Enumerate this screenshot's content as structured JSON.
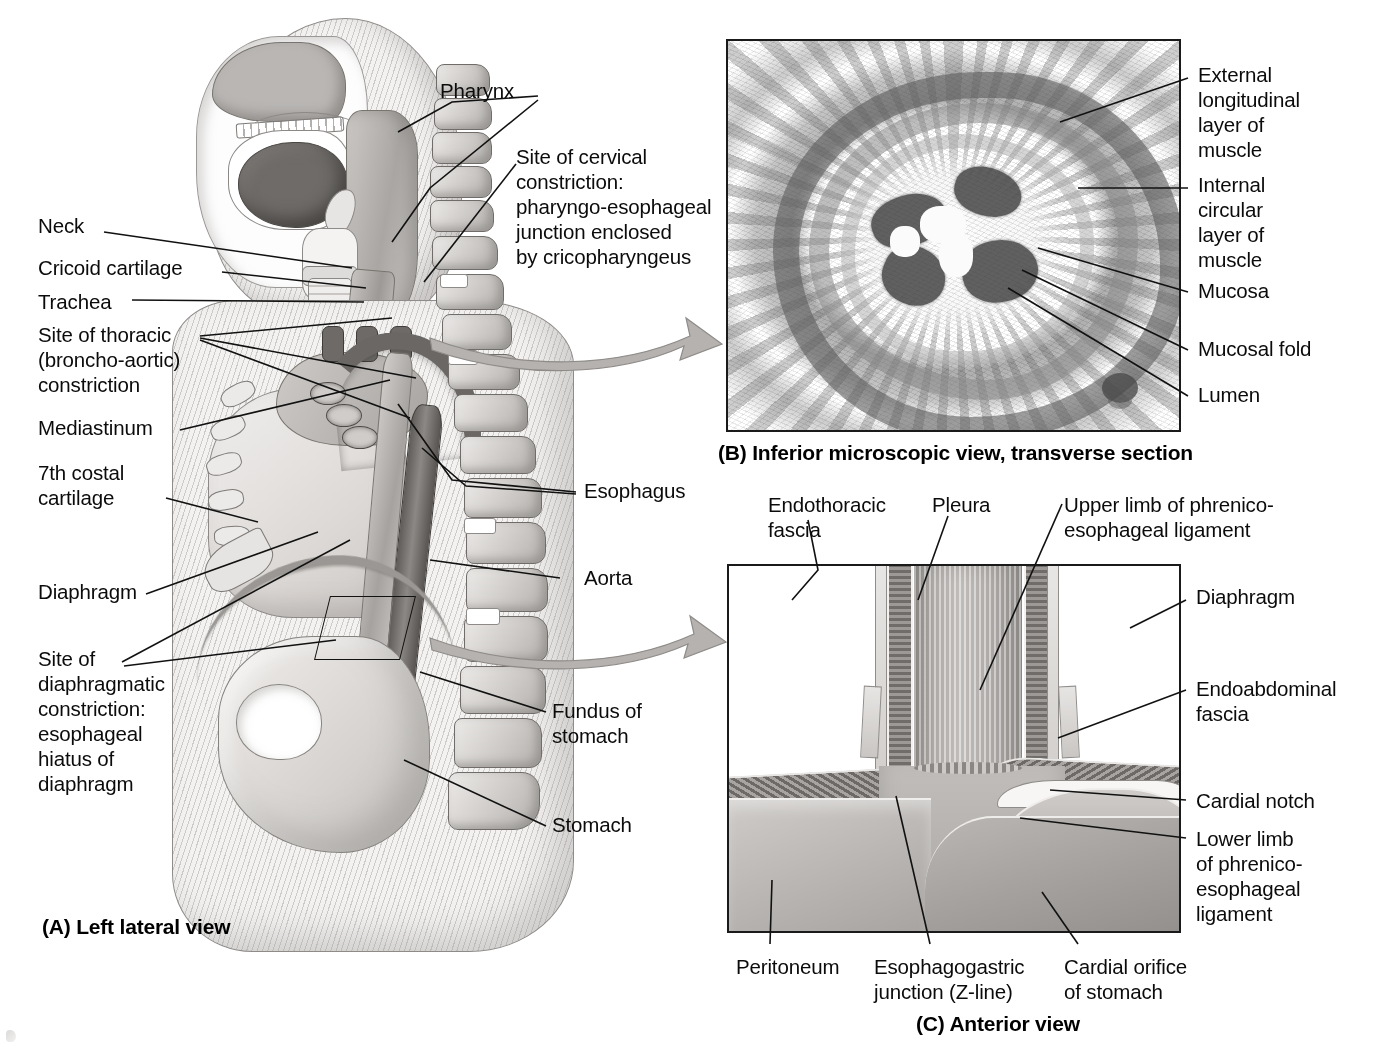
{
  "panel_a": {
    "caption": "(A) Left lateral view",
    "labels": [
      {
        "id": "pharynx",
        "text": "Pharynx"
      },
      {
        "id": "cervical_constriction",
        "text": "Site of cervical\nconstriction:\npharyngo-esophageal\njunction enclosed\nby cricopharyngeus"
      },
      {
        "id": "neck",
        "text": "Neck"
      },
      {
        "id": "cricoid_cartilage",
        "text": "Cricoid cartilage"
      },
      {
        "id": "trachea",
        "text": "Trachea"
      },
      {
        "id": "thoracic_constriction",
        "text": "Site of thoracic\n(broncho-aortic)\nconstriction"
      },
      {
        "id": "mediastinum",
        "text": "Mediastinum"
      },
      {
        "id": "costal_cartilage",
        "text": "7th costal\ncartilage"
      },
      {
        "id": "diaphragm",
        "text": "Diaphragm"
      },
      {
        "id": "diaphragmatic_constriction",
        "text": "Site of\ndiaphragmatic\nconstriction:\nesophageal\nhiatus of\ndiaphragm"
      },
      {
        "id": "esophagus",
        "text": "Esophagus"
      },
      {
        "id": "aorta",
        "text": "Aorta"
      },
      {
        "id": "fundus_of_stomach",
        "text": "Fundus of\nstomach"
      },
      {
        "id": "stomach",
        "text": "Stomach"
      }
    ]
  },
  "panel_b": {
    "caption": "(B) Inferior microscopic view, transverse section",
    "labels": [
      {
        "id": "external_longitudinal_muscle",
        "text": "External\nlongitudinal\nlayer of\nmuscle"
      },
      {
        "id": "internal_circular_muscle",
        "text": "Internal\ncircular\nlayer of\nmuscle"
      },
      {
        "id": "mucosa",
        "text": "Mucosa"
      },
      {
        "id": "mucosal_fold",
        "text": "Mucosal fold"
      },
      {
        "id": "lumen",
        "text": "Lumen"
      }
    ]
  },
  "panel_c": {
    "caption": "(C) Anterior view",
    "labels": [
      {
        "id": "endothoracic_fascia",
        "text": "Endothoracic\nfascia"
      },
      {
        "id": "pleura",
        "text": "Pleura"
      },
      {
        "id": "upper_limb_phrenico_esophageal",
        "text": "Upper limb of phrenico-\nesophageal ligament"
      },
      {
        "id": "diaphragm_c",
        "text": "Diaphragm"
      },
      {
        "id": "endoabdominal_fascia",
        "text": "Endoabdominal\nfascia"
      },
      {
        "id": "cardial_notch",
        "text": "Cardial notch"
      },
      {
        "id": "lower_limb_phrenico_esophageal",
        "text": "Lower limb\nof phrenico-\nesophageal\nligament"
      },
      {
        "id": "peritoneum",
        "text": "Peritoneum"
      },
      {
        "id": "esophagogastric_junction",
        "text": "Esophagogastric\njunction (Z-line)"
      },
      {
        "id": "cardial_orifice",
        "text": "Cardial orifice\nof stomach"
      }
    ]
  },
  "colors": {
    "ink": "#0b0b0b",
    "frame": "#1a1a1a",
    "arrow_fill": "#b5b2af",
    "arrow_stroke": "#8e8b88",
    "paper": "#ffffff"
  }
}
